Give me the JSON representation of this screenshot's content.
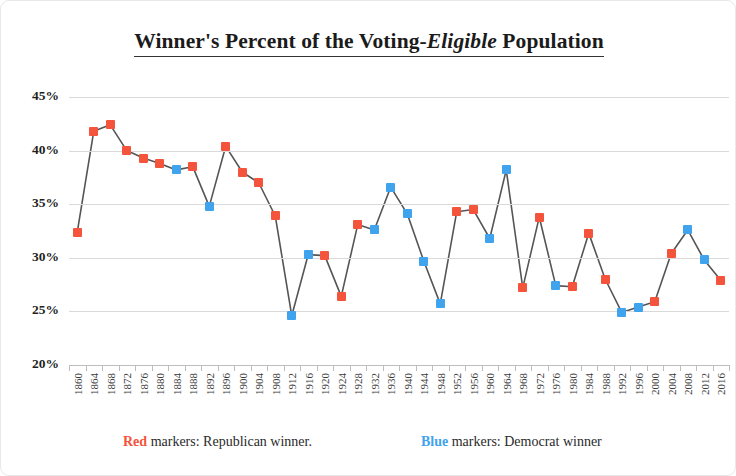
{
  "title": {
    "before": "Winner's Percent of the Voting-",
    "emphasis": "Eligible",
    "after": " Population"
  },
  "legend": {
    "republican": {
      "key": "Red",
      "text": " markers: Republican winner."
    },
    "democrat": {
      "key": "Blue",
      "text": " markers: Democrat winner"
    }
  },
  "colors": {
    "republican": "#f4533c",
    "democrat": "#3fa3ee",
    "gridline": "#d9d9d9",
    "axis": "#bdbdbd",
    "line": "#555555",
    "text": "#1f1f1f"
  },
  "chart_data": {
    "type": "line",
    "title": "Winner's Percent of the Voting-Eligible Population",
    "xlabel": "",
    "ylabel": "",
    "ylim": [
      20,
      45
    ],
    "yticks": [
      20,
      25,
      30,
      35,
      40,
      45
    ],
    "ytick_labels": [
      "20%",
      "25%",
      "30%",
      "35%",
      "40%",
      "45%"
    ],
    "grid": true,
    "legend_position": "bottom",
    "x": [
      1860,
      1864,
      1868,
      1872,
      1876,
      1880,
      1884,
      1888,
      1892,
      1896,
      1900,
      1904,
      1908,
      1912,
      1916,
      1920,
      1924,
      1928,
      1932,
      1936,
      1940,
      1944,
      1948,
      1952,
      1956,
      1960,
      1964,
      1968,
      1972,
      1976,
      1980,
      1984,
      1988,
      1992,
      1996,
      2000,
      2004,
      2008,
      2012,
      2016
    ],
    "xtick_labels": [
      "1860",
      "1864",
      "1868",
      "1872",
      "1876",
      "1880",
      "1884",
      "1888",
      "1892",
      "1896",
      "1900",
      "1904",
      "1908",
      "1912",
      "1916",
      "1920",
      "1924",
      "1928",
      "1932",
      "1936",
      "1940",
      "1944",
      "1948",
      "1952",
      "1956",
      "1960",
      "1964",
      "1968",
      "1972",
      "1976",
      "1980",
      "1984",
      "1988",
      "1992",
      "1996",
      "2000",
      "2004",
      "2008",
      "2012",
      "2016"
    ],
    "values": [
      32.4,
      41.8,
      42.4,
      40.0,
      39.3,
      38.8,
      38.2,
      38.5,
      34.8,
      40.4,
      38.0,
      37.0,
      33.9,
      24.6,
      30.3,
      30.2,
      26.4,
      33.1,
      32.6,
      36.6,
      34.1,
      29.7,
      25.7,
      34.3,
      34.5,
      31.8,
      38.2,
      27.2,
      33.8,
      27.4,
      27.3,
      32.3,
      28.0,
      24.9,
      25.4,
      25.9,
      30.4,
      32.6,
      29.8,
      27.9
    ],
    "party": [
      "R",
      "R",
      "R",
      "R",
      "R",
      "R",
      "D",
      "R",
      "D",
      "R",
      "R",
      "R",
      "R",
      "D",
      "D",
      "R",
      "R",
      "R",
      "D",
      "D",
      "D",
      "D",
      "D",
      "R",
      "R",
      "D",
      "D",
      "R",
      "R",
      "D",
      "R",
      "R",
      "R",
      "D",
      "D",
      "R",
      "R",
      "D",
      "D",
      "R"
    ],
    "series": [
      {
        "name": "Winner's percent of voting-eligible population",
        "values": [
          32.4,
          41.8,
          42.4,
          40.0,
          39.3,
          38.8,
          38.2,
          38.5,
          34.8,
          40.4,
          38.0,
          37.0,
          33.9,
          24.6,
          30.3,
          30.2,
          26.4,
          33.1,
          32.6,
          36.6,
          34.1,
          29.7,
          25.7,
          34.3,
          34.5,
          31.8,
          38.2,
          27.2,
          33.8,
          27.4,
          27.3,
          32.3,
          28.0,
          24.9,
          25.4,
          25.9,
          30.4,
          32.6,
          29.8,
          27.9
        ]
      }
    ]
  }
}
